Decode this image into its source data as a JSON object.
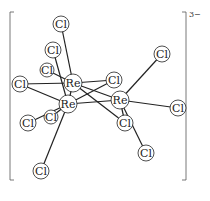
{
  "diagram": {
    "charge": "3−",
    "metal_label": "Re",
    "ligand_label": "Cl",
    "atoms": [
      {
        "id": "re1",
        "label": "Re",
        "x": 73,
        "y": 83,
        "r": 9
      },
      {
        "id": "re2",
        "label": "Re",
        "x": 68,
        "y": 104,
        "r": 9
      },
      {
        "id": "re3",
        "label": "Re",
        "x": 120,
        "y": 100,
        "r": 9
      },
      {
        "id": "cl1",
        "label": "Cl",
        "x": 61,
        "y": 24,
        "r": 8
      },
      {
        "id": "cl2",
        "label": "Cl",
        "x": 53,
        "y": 50,
        "r": 8
      },
      {
        "id": "cl3",
        "label": "Cl",
        "x": 47,
        "y": 70,
        "r": 7
      },
      {
        "id": "cl4",
        "label": "Cl",
        "x": 20,
        "y": 84,
        "r": 8
      },
      {
        "id": "cl5",
        "label": "Cl",
        "x": 114,
        "y": 80,
        "r": 8
      },
      {
        "id": "cl6",
        "label": "Cl",
        "x": 162,
        "y": 54,
        "r": 8
      },
      {
        "id": "cl7",
        "label": "Cl",
        "x": 178,
        "y": 108,
        "r": 8
      },
      {
        "id": "cl8",
        "label": "Cl",
        "x": 28,
        "y": 123,
        "r": 8
      },
      {
        "id": "cl9",
        "label": "Cl",
        "x": 51,
        "y": 117,
        "r": 7
      },
      {
        "id": "cl10",
        "label": "Cl",
        "x": 125,
        "y": 123,
        "r": 8
      },
      {
        "id": "cl11",
        "label": "Cl",
        "x": 146,
        "y": 153,
        "r": 8
      },
      {
        "id": "cl12",
        "label": "Cl",
        "x": 41,
        "y": 171,
        "r": 8
      }
    ],
    "bonds": [
      [
        "re1",
        "re2"
      ],
      [
        "re1",
        "re3"
      ],
      [
        "re2",
        "re3"
      ],
      [
        "re1",
        "cl1"
      ],
      [
        "re1",
        "cl3"
      ],
      [
        "re1",
        "cl4"
      ],
      [
        "re1",
        "cl5"
      ],
      [
        "re1",
        "cl10"
      ],
      [
        "re2",
        "cl2"
      ],
      [
        "re2",
        "cl4"
      ],
      [
        "re2",
        "cl8"
      ],
      [
        "re2",
        "cl12"
      ],
      [
        "re2",
        "cl5"
      ],
      [
        "re3",
        "cl6"
      ],
      [
        "re3",
        "cl7"
      ],
      [
        "re3",
        "cl10"
      ],
      [
        "re3",
        "cl11"
      ],
      [
        "re2",
        "cl9"
      ]
    ]
  }
}
